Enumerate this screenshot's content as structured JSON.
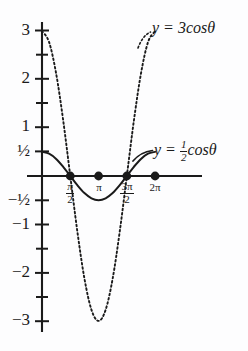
{
  "figure": {
    "title": "",
    "background_color": "#fdfdfe",
    "ink_color": "#1a1a1a"
  },
  "axes": {
    "y_tick_labels": [
      {
        "value": 3,
        "text": "3"
      },
      {
        "value": 2,
        "text": "2"
      },
      {
        "value": 1,
        "text": "1"
      },
      {
        "value": 0.5,
        "text": "½"
      },
      {
        "value": -0.5,
        "text": "−½"
      },
      {
        "value": -1,
        "text": "−1"
      },
      {
        "value": -2,
        "text": "−2"
      },
      {
        "value": -3,
        "text": "−3"
      }
    ],
    "y_minor_ticks": [
      2.5,
      1.5,
      -1.5,
      -2.5
    ],
    "x_tick_labels": [
      {
        "value": 1.5708,
        "kind": "fraction",
        "num": "π",
        "den": "2",
        "text": "π/2"
      },
      {
        "value": 3.1416,
        "kind": "plain",
        "text": "π"
      },
      {
        "value": 4.7124,
        "kind": "fraction",
        "num": "3π",
        "den": "2",
        "text": "3π/2"
      },
      {
        "value": 6.2832,
        "kind": "plain",
        "text": "2π"
      }
    ]
  },
  "annotations": {
    "curve1_label": {
      "prefix": "y = 3",
      "func": "cos",
      "variable": "θ",
      "full_text": "y = 3cosθ"
    },
    "curve2_label": {
      "prefix": "y = ",
      "frac_num": "1",
      "frac_den": "2",
      "func": "cos",
      "variable": "θ",
      "full_text": "y = ½cosθ"
    }
  },
  "chart_data": {
    "type": "line",
    "title": "",
    "xlabel": "",
    "ylabel": "",
    "xlim": [
      -0.35,
      7.6
    ],
    "ylim": [
      -3.35,
      3.35
    ],
    "grid": false,
    "legend": "inline-annotations",
    "series": [
      {
        "name": "y = 3cosθ",
        "amplitude": 3,
        "function": "3*cos(theta)",
        "style": "dotted",
        "color": "#1a1a1a",
        "x": [
          0,
          0.3927,
          0.7854,
          1.1781,
          1.5708,
          1.9635,
          2.3562,
          2.7489,
          3.1416,
          3.5343,
          3.927,
          4.3197,
          4.7124,
          5.1051,
          5.4978,
          5.8905,
          6.2832
        ],
        "y": [
          3,
          2.772,
          2.121,
          1.148,
          0,
          -1.148,
          -2.121,
          -2.772,
          -3,
          -2.772,
          -2.121,
          -1.148,
          0,
          1.148,
          2.121,
          2.772,
          3
        ]
      },
      {
        "name": "y = ½cosθ",
        "amplitude": 0.5,
        "function": "0.5*cos(theta)",
        "style": "solid",
        "color": "#1a1a1a",
        "x": [
          0,
          0.3927,
          0.7854,
          1.1781,
          1.5708,
          1.9635,
          2.3562,
          2.7489,
          3.1416,
          3.5343,
          3.927,
          4.3197,
          4.7124,
          5.1051,
          5.4978,
          5.8905,
          6.2832
        ],
        "y": [
          0.5,
          0.462,
          0.354,
          0.191,
          0,
          -0.191,
          -0.354,
          -0.462,
          -0.5,
          -0.462,
          -0.354,
          -0.191,
          0,
          0.191,
          0.354,
          0.462,
          0.5
        ]
      }
    ],
    "marked_points": [
      {
        "label": "π/2",
        "x": 1.5708,
        "y": 0
      },
      {
        "label": "π",
        "x": 3.1416,
        "y": 0
      },
      {
        "label": "3π/2",
        "x": 4.7124,
        "y": 0
      },
      {
        "label": "2π",
        "x": 6.2832,
        "y": 0
      }
    ],
    "annotations": [
      {
        "text": "y = 3cosθ",
        "points_to_series": "y = 3cosθ"
      },
      {
        "text": "y = ½cosθ",
        "points_to_series": "y = ½cosθ"
      }
    ]
  }
}
